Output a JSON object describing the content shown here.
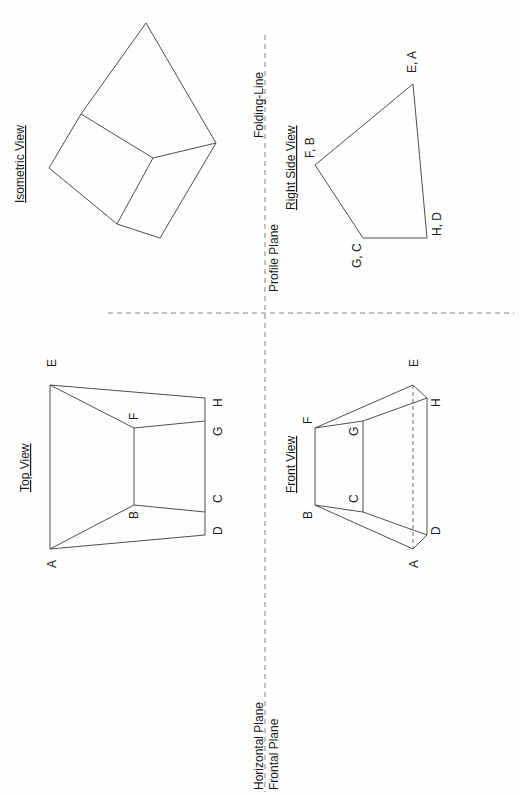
{
  "diagram": {
    "type": "orthographic-projection",
    "orientation": "rotated 90deg counter-clockwise",
    "colors": {
      "line": "#3a3a3a",
      "fold_line": "#777777",
      "background": "#fefefe"
    },
    "planes": {
      "horizontal": "Horizontal Plane",
      "frontal": "Frontal Plane",
      "profile": "Profile Plane",
      "folding_line": "Folding-Line"
    },
    "views": {
      "top": {
        "title": "Top View",
        "labels": {
          "A": "A",
          "B": "B",
          "C": "C",
          "D": "D",
          "E": "E",
          "F": "F",
          "G": "G",
          "H": "H"
        }
      },
      "front": {
        "title": "Front View",
        "labels": {
          "A": "A",
          "B": "B",
          "C": "C",
          "D": "D",
          "E": "E",
          "F": "F",
          "G": "G",
          "H": "H"
        }
      },
      "right_side": {
        "title": "Right Side View",
        "labels": {
          "FB": "F, B",
          "EA": "E, A",
          "GC": "G, C",
          "HD": "H, D"
        }
      },
      "isometric": {
        "title": "Isometric View"
      }
    }
  }
}
